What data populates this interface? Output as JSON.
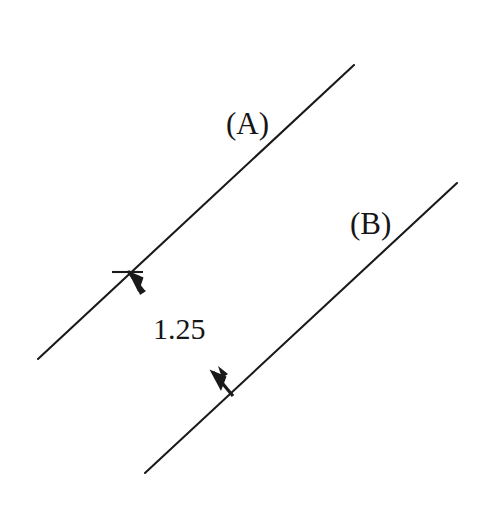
{
  "figure": {
    "title": "",
    "background_color": "#ffffff",
    "stroke_color": "#1a1a1a",
    "width": 483,
    "height": 513,
    "labels": {
      "line_a": "(A)",
      "line_b": "(B)",
      "distance": "1.25"
    },
    "elements": {
      "line_a_name": "line-a",
      "line_b_name": "line-b",
      "dimension_name": "distance-dimension"
    }
  },
  "chart_data": {
    "type": "diagram",
    "subtype": "parallel-lines-distance",
    "title": "",
    "xlabel": "",
    "ylabel": "",
    "grid": false,
    "legend": null,
    "axis_ranges": {
      "x": [
        0,
        483
      ],
      "y": [
        0,
        513
      ]
    },
    "lines": [
      {
        "name": "(A)",
        "label": "(A)",
        "x1": 38,
        "y1": 359,
        "x2": 354,
        "y2": 65,
        "slope": -0.93,
        "stroke_width": 2.1,
        "color": "#1a1a1a"
      },
      {
        "name": "(B)",
        "label": "(B)",
        "x1": 145,
        "y1": 473,
        "x2": 457,
        "y2": 183,
        "slope": -0.929,
        "stroke_width": 2.1,
        "color": "#1a1a1a"
      }
    ],
    "dimension": {
      "label": "1.25",
      "value": 1.25,
      "from_line": "(A)",
      "to_line": "(B)",
      "perpendicular": true,
      "arrow_upper": {
        "tip_x": 126,
        "tip_y": 269,
        "tail_x": 145,
        "tail_y": 294,
        "points_toward": "(A)"
      },
      "arrow_lower": {
        "tip_x": 210,
        "tip_y": 371,
        "tail_x": 234,
        "tail_y": 397,
        "points_toward": "(B)"
      },
      "tick_upper": {
        "x1": 112,
        "y1": 272,
        "x2": 143,
        "y2": 272
      }
    },
    "annotations": [
      {
        "text": "(A)",
        "x": 226,
        "y": 108,
        "font_size": 31
      },
      {
        "text": "(B)",
        "x": 350,
        "y": 208,
        "font_size": 31
      },
      {
        "text": "1.25",
        "x": 153,
        "y": 314,
        "font_size": 30
      }
    ]
  }
}
